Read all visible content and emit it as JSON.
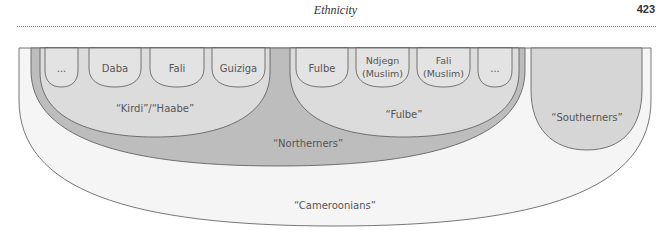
{
  "header": {
    "title": "Ethnicity",
    "page_number": "423"
  },
  "diagram": {
    "colors": {
      "cameroonians": "#f5f5f5",
      "northerners": "#bdbdbd",
      "subgroup": "#dcdcdc",
      "southerners": "#d6d6d6",
      "box": "#e3e3e3",
      "stroke": "#555555"
    },
    "outer_label": "“Cameroonians”",
    "northerners_label": "“Northerners”",
    "southerners_label": "“Southerners”",
    "groups": [
      {
        "label": "“Kirdi”/“Haabe”",
        "members": [
          {
            "line1": "...",
            "line2": ""
          },
          {
            "line1": "Daba",
            "line2": ""
          },
          {
            "line1": "Fali",
            "line2": ""
          },
          {
            "line1": "Guiziga",
            "line2": ""
          }
        ]
      },
      {
        "label": "“Fulbe”",
        "members": [
          {
            "line1": "Fulbe",
            "line2": ""
          },
          {
            "line1": "Ndjegn",
            "line2": "(Muslim)"
          },
          {
            "line1": "Fali",
            "line2": "(Muslim)"
          },
          {
            "line1": "...",
            "line2": ""
          }
        ]
      }
    ]
  }
}
